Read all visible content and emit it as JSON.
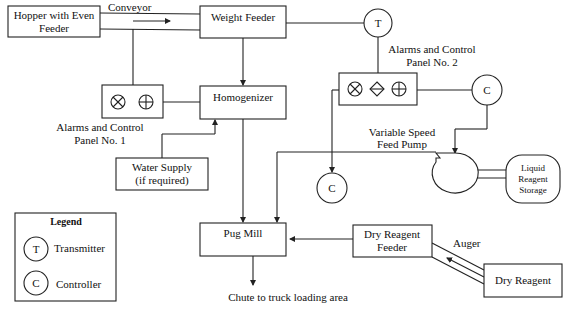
{
  "nodes": {
    "hopper": {
      "line1": "Hopper with Even",
      "line2": "Feeder"
    },
    "weight_feeder": {
      "label": "Weight Feeder"
    },
    "homogenizer": {
      "label": "Homogenizer"
    },
    "water_supply": {
      "line1": "Water Supply",
      "line2": "(if required)"
    },
    "pug_mill": {
      "label": "Pug Mill"
    },
    "dry_reagent_feeder": {
      "line1": "Dry Reagent",
      "line2": "Feeder"
    },
    "dry_reagent": {
      "label": "Dry Reagent"
    },
    "liquid_storage": {
      "line1": "Liquid",
      "line2": "Reagent",
      "line3": "Storage"
    },
    "transmitter": {
      "symbol": "T"
    },
    "controller_right": {
      "symbol": "C"
    },
    "controller_low": {
      "symbol": "C"
    }
  },
  "labels": {
    "conveyor": "Conveyor",
    "auger": "Auger",
    "panel1_line1": "Alarms and Control",
    "panel1_line2": "Panel No. 1",
    "panel2_line1": "Alarms and Control",
    "panel2_line2": "Panel No. 2",
    "pump_line1": "Variable Speed",
    "pump_line2": "Feed Pump",
    "chute": "Chute to truck loading area"
  },
  "legend": {
    "title": "Legend",
    "items": [
      {
        "symbol": "T",
        "label": "Transmitter"
      },
      {
        "symbol": "C",
        "label": "Controller"
      }
    ]
  },
  "panel_icons": {
    "panel1": [
      "cross-circle-icon",
      "plus-circle-icon"
    ],
    "panel2": [
      "cross-circle-icon",
      "diamond-icon",
      "plus-circle-icon"
    ]
  }
}
